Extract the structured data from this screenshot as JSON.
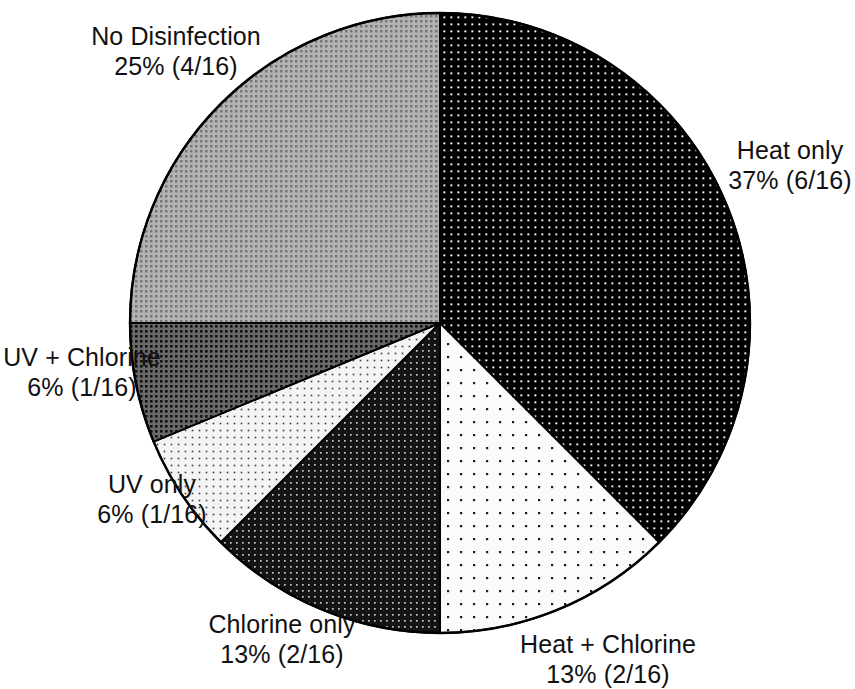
{
  "chart_data": {
    "type": "pie",
    "title": "",
    "subtitle": "",
    "xlabel": "",
    "ylabel": "",
    "total": 16,
    "total_label": "16",
    "legend": "none",
    "grid": false,
    "labels_position": "outside",
    "start_angle_deg": 0,
    "direction": "clockwise",
    "categories": [
      "Heat only",
      "Heat + Chlorine",
      "Chlorine only",
      "UV only",
      "UV + Chlorine",
      "No Disinfection"
    ],
    "values": [
      6,
      2,
      2,
      1,
      1,
      4
    ],
    "percentages": [
      37,
      13,
      13,
      6,
      6,
      25
    ],
    "slices": [
      {
        "id": "heat-only",
        "name": "Heat only",
        "percent_text": "37%",
        "count_text": "(6/16)",
        "value_text": "37% (6/16)",
        "value": 6,
        "percent": 37,
        "start_deg": 0,
        "end_deg": 135,
        "fill": "#000000",
        "dot": "#ffffff",
        "pattern": "black-with-white-dots"
      },
      {
        "id": "heat-chlorine",
        "name": "Heat + Chlorine",
        "percent_text": "13%",
        "count_text": "(2/16)",
        "value_text": "13% (2/16)",
        "value": 2,
        "percent": 13,
        "start_deg": 135,
        "end_deg": 180,
        "fill": "#fbfbfb",
        "dot": "#1b1b1b",
        "pattern": "white-with-sparse-black-dots"
      },
      {
        "id": "chlorine-only",
        "name": "Chlorine only",
        "percent_text": "13%",
        "count_text": "(2/16)",
        "value_text": "13% (2/16)",
        "value": 2,
        "percent": 13,
        "start_deg": 180,
        "end_deg": 225,
        "fill": "#141414",
        "dot": "#cfcfcf",
        "pattern": "near-black-with-light-dots"
      },
      {
        "id": "uv-only",
        "name": "UV only",
        "percent_text": "6%",
        "count_text": "(1/16)",
        "value_text": "6% (1/16)",
        "value": 1,
        "percent": 6,
        "start_deg": 225,
        "end_deg": 247.5,
        "fill": "#f2f2f2",
        "dot": "#3a3a3a",
        "pattern": "very-light-with-fine-dots"
      },
      {
        "id": "uv-chlorine",
        "name": "UV + Chlorine",
        "percent_text": "6%",
        "count_text": "(1/16)",
        "value_text": "6% (1/16)",
        "value": 1,
        "percent": 6,
        "start_deg": 247.5,
        "end_deg": 270,
        "fill": "#4f4f4f",
        "dot": "#0a0a0a",
        "pattern": "dark-gray-halftone"
      },
      {
        "id": "no-disinfection",
        "name": "No Disinfection",
        "percent_text": "25%",
        "count_text": "(4/16)",
        "value_text": "25% (4/16)",
        "value": 4,
        "percent": 25,
        "start_deg": 270,
        "end_deg": 360,
        "fill": "#9a9a9a",
        "dot": "#dedede",
        "pattern": "medium-gray-halftone"
      }
    ],
    "geometry": {
      "center_x": 440,
      "center_y": 323,
      "radius": 310,
      "outline_color": "#000000",
      "outline_width": 2
    },
    "colors": {
      "background": "#ffffff",
      "text": "#111111",
      "outline": "#000000"
    }
  }
}
